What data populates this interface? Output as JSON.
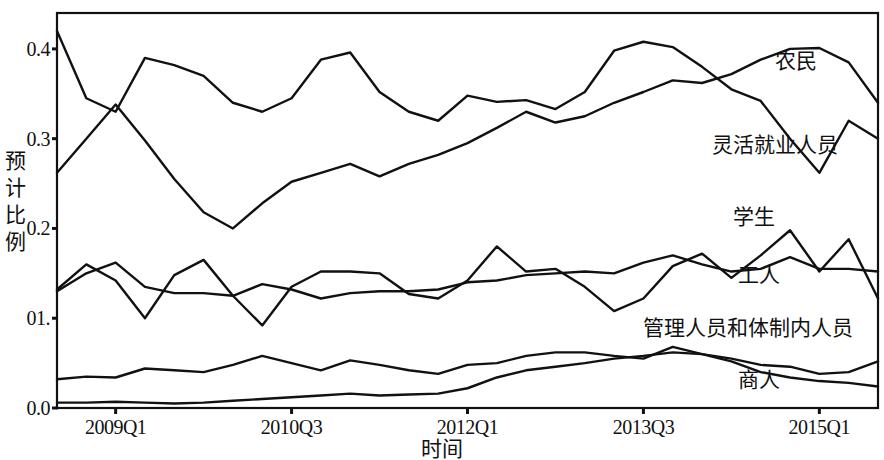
{
  "chart_data": {
    "type": "line",
    "title": "",
    "xlabel": "时间",
    "ylabel": "预计比例",
    "ylim": [
      0.0,
      0.44
    ],
    "xlim": [
      0,
      30
    ],
    "grid": false,
    "legend_position": "inline-right",
    "ytick_labels": [
      "0.4",
      "0.3",
      "0.2",
      "01.",
      "0.0"
    ],
    "ytick_values": [
      0.4,
      0.3,
      0.2,
      0.1,
      0.0
    ],
    "xtick_labels": [
      "2009Q1",
      "2010Q3",
      "2012Q1",
      "2013Q3",
      "2015Q1"
    ],
    "xtick_indices": [
      2,
      8,
      14,
      20,
      26
    ],
    "x": [
      0,
      1,
      2,
      3,
      4,
      5,
      6,
      7,
      8,
      9,
      10,
      11,
      12,
      13,
      14,
      15,
      16,
      17,
      18,
      19,
      20,
      21,
      22,
      23,
      24,
      25,
      26,
      27,
      28
    ],
    "series": [
      {
        "name": "农民",
        "label": "农民",
        "color": "#111111",
        "values": [
          0.262,
          0.3,
          0.338,
          0.298,
          0.255,
          0.218,
          0.2,
          0.228,
          0.252,
          0.262,
          0.272,
          0.258,
          0.272,
          0.282,
          0.295,
          0.312,
          0.33,
          0.318,
          0.325,
          0.34,
          0.352,
          0.365,
          0.362,
          0.372,
          0.388,
          0.4,
          0.401,
          0.385,
          0.34
        ]
      },
      {
        "name": "灵活就业人员",
        "label": "灵活就业人员",
        "color": "#111111",
        "values": [
          0.42,
          0.345,
          0.33,
          0.39,
          0.382,
          0.37,
          0.34,
          0.33,
          0.345,
          0.388,
          0.396,
          0.352,
          0.33,
          0.32,
          0.348,
          0.341,
          0.343,
          0.333,
          0.352,
          0.398,
          0.408,
          0.402,
          0.38,
          0.355,
          0.342,
          0.3,
          0.262,
          0.32,
          0.3
        ]
      },
      {
        "name": "学生",
        "label": "学生",
        "color": "#111111",
        "values": [
          0.132,
          0.16,
          0.142,
          0.1,
          0.148,
          0.165,
          0.125,
          0.092,
          0.135,
          0.152,
          0.152,
          0.15,
          0.127,
          0.122,
          0.142,
          0.18,
          0.152,
          0.155,
          0.135,
          0.108,
          0.122,
          0.158,
          0.172,
          0.145,
          0.17,
          0.198,
          0.152,
          0.188,
          0.122
        ]
      },
      {
        "name": "工人",
        "label": "工人",
        "color": "#111111",
        "values": [
          0.13,
          0.15,
          0.162,
          0.135,
          0.128,
          0.128,
          0.125,
          0.138,
          0.132,
          0.122,
          0.128,
          0.13,
          0.13,
          0.132,
          0.14,
          0.142,
          0.148,
          0.15,
          0.152,
          0.15,
          0.162,
          0.17,
          0.16,
          0.152,
          0.155,
          0.168,
          0.155,
          0.155,
          0.152
        ]
      },
      {
        "name": "管理人员和体制内人员",
        "label": "管理人员和体制内人员",
        "color": "#111111",
        "values": [
          0.032,
          0.035,
          0.034,
          0.044,
          0.042,
          0.04,
          0.048,
          0.058,
          0.05,
          0.042,
          0.053,
          0.048,
          0.042,
          0.038,
          0.048,
          0.05,
          0.058,
          0.062,
          0.062,
          0.058,
          0.055,
          0.068,
          0.06,
          0.055,
          0.048,
          0.046,
          0.038,
          0.04,
          0.052
        ]
      },
      {
        "name": "商人",
        "label": "商人",
        "color": "#111111",
        "values": [
          0.006,
          0.006,
          0.007,
          0.006,
          0.005,
          0.006,
          0.008,
          0.01,
          0.012,
          0.014,
          0.016,
          0.014,
          0.015,
          0.016,
          0.022,
          0.034,
          0.042,
          0.046,
          0.05,
          0.055,
          0.058,
          0.062,
          0.06,
          0.052,
          0.04,
          0.034,
          0.03,
          0.028,
          0.024
        ]
      }
    ],
    "annotations": [
      {
        "text": "农民",
        "x_px": 775,
        "y_px": 44
      },
      {
        "text": "灵活就业人员",
        "x_px": 712,
        "y_px": 128
      },
      {
        "text": "学生",
        "x_px": 733,
        "y_px": 200
      },
      {
        "text": "工人",
        "x_px": 738,
        "y_px": 258
      },
      {
        "text": "管理人员和体制内人员",
        "x_px": 643,
        "y_px": 311
      },
      {
        "text": "商人",
        "x_px": 738,
        "y_px": 363
      }
    ]
  }
}
